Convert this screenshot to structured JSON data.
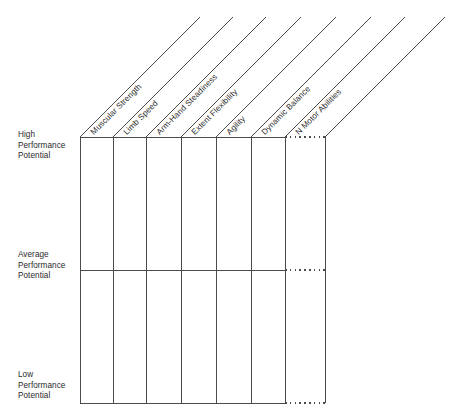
{
  "figure": {
    "type": "schematic-grid-diagram",
    "title": "",
    "background_color": "#ffffff",
    "line_color": "#4a4a4a",
    "text_color": "#2b2b2b"
  },
  "y_axis": {
    "name": "performance-potential-scale",
    "levels": [
      {
        "key": "high",
        "label": "High\nPerformance\nPotential",
        "y": 137
      },
      {
        "key": "average",
        "label": "Average\nPerformance\nPotential",
        "y": 270
      },
      {
        "key": "low",
        "label": "Low\nPerformance\nPotential",
        "y": 403
      }
    ]
  },
  "columns": {
    "name": "motor-ability-columns",
    "count": 7,
    "labels": [
      "Muscular Strength",
      "Limb Speed",
      "Arm-Hand Steadiness",
      "Extent Flexibility",
      "Agility",
      "Dynamic Balance",
      "N Motor Abilities"
    ],
    "boundaries_x": [
      80,
      113,
      146,
      181,
      216,
      251,
      285,
      325
    ],
    "last_column_is_continuation": true
  },
  "grid": {
    "left": 80,
    "right": 325,
    "top": 137,
    "middle": 270,
    "bottom": 403,
    "solid_end_x": 285,
    "dotted_start_x": 285,
    "dotted_end_x": 325
  },
  "diagonals": {
    "name": "column-leader-lines",
    "count": 8,
    "length": 120,
    "angle_deg": 45
  },
  "chart_data": {
    "type": "table",
    "title": "",
    "xlabel": "",
    "ylabel": "Performance Potential",
    "categories": [
      "Muscular Strength",
      "Limb Speed",
      "Arm-Hand Steadiness",
      "Extent Flexibility",
      "Agility",
      "Dynamic Balance",
      "N Motor Abilities"
    ],
    "ytick_labels": [
      "High Performance Potential",
      "Average Performance Potential",
      "Low Performance Potential"
    ],
    "grid": true,
    "legend": "none",
    "annotations": [
      "Last column drawn with dotted horizontal rules to denote an open-ended series of N motor abilities."
    ]
  }
}
